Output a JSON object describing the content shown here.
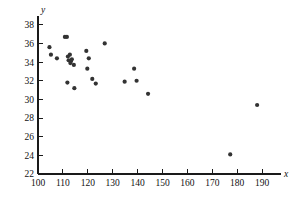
{
  "chart_data": {
    "type": "scatter",
    "title": "",
    "subtitle": "",
    "xlabel": "x",
    "ylabel": "y",
    "xlim": [
      100,
      196
    ],
    "ylim": [
      22,
      39
    ],
    "xticks": [
      100,
      110,
      120,
      130,
      140,
      150,
      160,
      170,
      180,
      190
    ],
    "yticks": [
      22,
      24,
      26,
      28,
      30,
      32,
      34,
      36,
      38
    ],
    "xtick_labels": [
      "100",
      "110",
      "120",
      "130",
      "140",
      "150",
      "160",
      "170",
      "180",
      "190"
    ],
    "ytick_labels": [
      "22",
      "24",
      "26",
      "28",
      "30",
      "32",
      "34",
      "36",
      "38"
    ],
    "grid": false,
    "legend": null,
    "annotations": [],
    "marker": {
      "shape": "circle",
      "color": "#333333",
      "size": 2.1
    },
    "n_points": 26,
    "points": [
      {
        "x": 104.6,
        "y": 35.6
      },
      {
        "x": 105.2,
        "y": 34.8
      },
      {
        "x": 107.6,
        "y": 34.4
      },
      {
        "x": 110.8,
        "y": 36.7
      },
      {
        "x": 111.6,
        "y": 36.7
      },
      {
        "x": 112.0,
        "y": 34.6
      },
      {
        "x": 112.3,
        "y": 34.2
      },
      {
        "x": 112.8,
        "y": 34.8
      },
      {
        "x": 113.2,
        "y": 34.1
      },
      {
        "x": 113.0,
        "y": 33.9
      },
      {
        "x": 114.4,
        "y": 33.7
      },
      {
        "x": 111.8,
        "y": 31.8
      },
      {
        "x": 114.6,
        "y": 31.2
      },
      {
        "x": 119.4,
        "y": 35.2
      },
      {
        "x": 120.4,
        "y": 34.4
      },
      {
        "x": 119.8,
        "y": 33.3
      },
      {
        "x": 121.8,
        "y": 32.2
      },
      {
        "x": 123.2,
        "y": 31.7
      },
      {
        "x": 126.8,
        "y": 36.0
      },
      {
        "x": 134.8,
        "y": 31.9
      },
      {
        "x": 138.6,
        "y": 33.3
      },
      {
        "x": 139.6,
        "y": 32.0
      },
      {
        "x": 144.2,
        "y": 30.6
      },
      {
        "x": 177.2,
        "y": 24.1
      },
      {
        "x": 188.0,
        "y": 29.4
      },
      {
        "x": 113.6,
        "y": 34.3
      }
    ]
  }
}
